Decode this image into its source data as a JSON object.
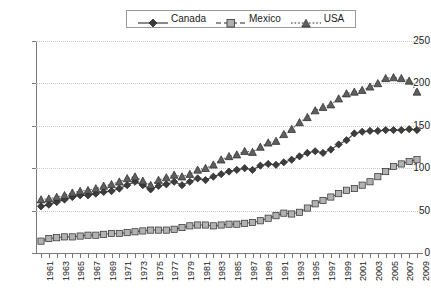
{
  "chart_data": {
    "type": "line",
    "title": "",
    "subtitle": "",
    "xlabel": "",
    "ylabel": "",
    "xlim": [
      1961,
      2009
    ],
    "ylim": [
      0,
      250
    ],
    "yticks": [
      0,
      50,
      100,
      150,
      200,
      250
    ],
    "grid": true,
    "legend_position": "top-center",
    "x": [
      1961,
      1962,
      1963,
      1964,
      1965,
      1966,
      1967,
      1968,
      1969,
      1970,
      1971,
      1972,
      1973,
      1974,
      1975,
      1976,
      1977,
      1978,
      1979,
      1980,
      1981,
      1982,
      1983,
      1984,
      1985,
      1986,
      1987,
      1988,
      1989,
      1990,
      1991,
      1992,
      1993,
      1994,
      1995,
      1996,
      1997,
      1998,
      1999,
      2000,
      2001,
      2002,
      2003,
      2004,
      2005,
      2006,
      2007,
      2008,
      2009
    ],
    "xtick_labels": [
      "1961",
      "1963",
      "1965",
      "1967",
      "1969",
      "1971",
      "1973",
      "1975",
      "1977",
      "1979",
      "1981",
      "1983",
      "1985",
      "1987",
      "1989",
      "1991",
      "1993",
      "1995",
      "1997",
      "1999",
      "2001",
      "2003",
      "2005",
      "2007",
      "2009"
    ],
    "series": [
      {
        "name": "Canada",
        "marker": "diamond",
        "line_style": "solid",
        "color": "#4a4a4a",
        "values": [
          55,
          57,
          60,
          63,
          66,
          68,
          68,
          70,
          72,
          73,
          76,
          80,
          84,
          80,
          75,
          79,
          81,
          84,
          80,
          84,
          88,
          86,
          90,
          93,
          96,
          98,
          100,
          98,
          103,
          105,
          104,
          107,
          110,
          114,
          118,
          120,
          118,
          122,
          128,
          133,
          141,
          143,
          144,
          144,
          145,
          145,
          145,
          146,
          145
        ]
      },
      {
        "name": "Mexico",
        "marker": "square",
        "line_style": "dashed",
        "color": "#a6a6a6",
        "values": [
          14,
          17,
          18,
          19,
          19,
          20,
          21,
          21,
          22,
          23,
          23,
          24,
          25,
          26,
          27,
          27,
          27,
          28,
          30,
          32,
          33,
          33,
          32,
          33,
          34,
          34,
          35,
          36,
          38,
          41,
          44,
          47,
          46,
          48,
          53,
          58,
          62,
          66,
          70,
          74,
          76,
          80,
          84,
          90,
          96,
          102,
          105,
          108,
          110
        ]
      },
      {
        "name": "USA",
        "marker": "triangle",
        "line_style": "dotted",
        "color": "#5f5f5f",
        "values": [
          63,
          64,
          66,
          68,
          71,
          73,
          74,
          76,
          79,
          81,
          84,
          88,
          90,
          85,
          80,
          86,
          89,
          92,
          90,
          93,
          98,
          100,
          104,
          110,
          114,
          116,
          120,
          119,
          125,
          130,
          132,
          140,
          146,
          154,
          160,
          168,
          172,
          175,
          182,
          188,
          190,
          192,
          196,
          200,
          206,
          207,
          206,
          203,
          190
        ]
      }
    ]
  },
  "legend": {
    "entries": [
      {
        "label": "Canada"
      },
      {
        "label": "Mexico"
      },
      {
        "label": "USA"
      }
    ]
  }
}
